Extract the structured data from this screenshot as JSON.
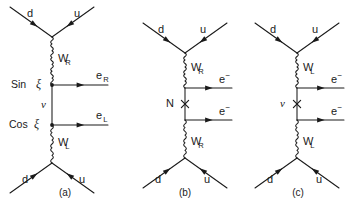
{
  "figure": {
    "background_color": "#ffffff",
    "line_color": "#1a1a1a",
    "width": 350,
    "height": 211
  },
  "diagrams": [
    {
      "id": "a",
      "caption": "(a)",
      "caption_x": 57,
      "caption_y": 193,
      "top_vertex": {
        "x": 52,
        "y": 37
      },
      "bottom_vertex": {
        "x": 52,
        "y": 163
      },
      "upper_mix_vertex": {
        "x": 52,
        "y": 85
      },
      "lower_mix_vertex": {
        "x": 52,
        "y": 125
      },
      "quarks": {
        "top_in_label": "d",
        "top_out_label": "u",
        "bottom_in_label": "d",
        "bottom_out_label": "u",
        "top_in_label_x": 27,
        "top_in_label_y": 14,
        "top_out_label_x": 74,
        "top_out_label_y": 14,
        "bottom_in_label_x": 22,
        "bottom_in_label_y": 180,
        "bottom_out_label_x": 79,
        "bottom_out_label_y": 180
      },
      "bosons": [
        {
          "label_base": "W",
          "label_sub": "R",
          "x": 58,
          "y": 59,
          "from": {
            "x": 52,
            "y": 37
          },
          "to": {
            "x": 52,
            "y": 85
          }
        },
        {
          "label_base": "W",
          "label_sub": "L",
          "x": 58,
          "y": 143,
          "from": {
            "x": 52,
            "y": 125
          },
          "to": {
            "x": 52,
            "y": 163
          }
        }
      ],
      "leptons": [
        {
          "label_base": "e",
          "label_sup": "",
          "label_sub": "R",
          "line_y": 85,
          "x_start": 52,
          "x_end": 108,
          "label_x": 96,
          "label_y": 76
        },
        {
          "label_base": "e",
          "label_sup": "",
          "label_sub": "L",
          "line_y": 125,
          "x_start": 52,
          "x_end": 108,
          "label_x": 96,
          "label_y": 116
        }
      ],
      "mixing_labels": [
        {
          "text": "Sin",
          "symbol": "ξ",
          "x": 11,
          "y": 85
        },
        {
          "text": "Cos",
          "symbol": "ξ",
          "x": 9,
          "y": 125
        }
      ],
      "propagator_label": {
        "symbol": "ν",
        "x": 41,
        "y": 105
      },
      "has_cross": false
    },
    {
      "id": "b",
      "caption": "(b)",
      "caption_x": 177,
      "caption_y": 193,
      "top_vertex": {
        "x": 185,
        "y": 53
      },
      "bottom_vertex": {
        "x": 185,
        "y": 158
      },
      "upper_mix_vertex": {
        "x": 185,
        "y": 88
      },
      "lower_mix_vertex": {
        "x": 185,
        "y": 120
      },
      "quarks": {
        "top_in_label": "d",
        "top_out_label": "u",
        "bottom_in_label": "d",
        "bottom_out_label": "u",
        "top_in_label_x": 158,
        "top_in_label_y": 30,
        "top_out_label_x": 200,
        "top_out_label_y": 30,
        "bottom_in_label_x": 155,
        "bottom_in_label_y": 180,
        "bottom_out_label_x": 204,
        "bottom_out_label_y": 180
      },
      "bosons": [
        {
          "label_base": "W",
          "label_sub": "R",
          "x": 191,
          "y": 68,
          "from": {
            "x": 185,
            "y": 53
          },
          "to": {
            "x": 185,
            "y": 88
          }
        },
        {
          "label_base": "W",
          "label_sub": "R",
          "x": 191,
          "y": 142,
          "from": {
            "x": 185,
            "y": 120
          },
          "to": {
            "x": 185,
            "y": 158
          }
        }
      ],
      "leptons": [
        {
          "label_base": "e",
          "label_sup": "−",
          "label_sub": "",
          "line_y": 88,
          "x_start": 185,
          "x_end": 232,
          "label_x": 219,
          "label_y": 80
        },
        {
          "label_base": "e",
          "label_sup": "−",
          "label_sub": "",
          "line_y": 120,
          "x_start": 185,
          "x_end": 232,
          "label_x": 219,
          "label_y": 112
        }
      ],
      "mixing_labels": [],
      "propagator_label": {
        "symbol": "N",
        "x": 166,
        "y": 104
      },
      "has_cross": true,
      "cross": {
        "x": 185,
        "y": 104,
        "size": 3.6
      }
    },
    {
      "id": "c",
      "caption": "(c)",
      "caption_x": 290,
      "caption_y": 193,
      "top_vertex": {
        "x": 297,
        "y": 53
      },
      "bottom_vertex": {
        "x": 297,
        "y": 158
      },
      "upper_mix_vertex": {
        "x": 297,
        "y": 88
      },
      "lower_mix_vertex": {
        "x": 297,
        "y": 120
      },
      "quarks": {
        "top_in_label": "d",
        "top_out_label": "u",
        "bottom_in_label": "d",
        "bottom_out_label": "u",
        "top_in_label_x": 270,
        "top_in_label_y": 30,
        "top_out_label_x": 312,
        "top_out_label_y": 30,
        "bottom_in_label_x": 267,
        "bottom_in_label_y": 180,
        "bottom_out_label_x": 316,
        "bottom_out_label_y": 180
      },
      "bosons": [
        {
          "label_base": "W",
          "label_sub": "L",
          "x": 303,
          "y": 68,
          "from": {
            "x": 297,
            "y": 53
          },
          "to": {
            "x": 297,
            "y": 88
          }
        },
        {
          "label_base": "W",
          "label_sub": "L",
          "x": 303,
          "y": 142,
          "from": {
            "x": 297,
            "y": 120
          },
          "to": {
            "x": 297,
            "y": 158
          }
        }
      ],
      "leptons": [
        {
          "label_base": "e",
          "label_sup": "−",
          "label_sub": "",
          "line_y": 88,
          "x_start": 297,
          "x_end": 344,
          "label_x": 331,
          "label_y": 80
        },
        {
          "label_base": "e",
          "label_sup": "−",
          "label_sub": "",
          "line_y": 120,
          "x_start": 297,
          "x_end": 344,
          "label_x": 331,
          "label_y": 112
        }
      ],
      "mixing_labels": [],
      "propagator_label": {
        "symbol": "ν",
        "x": 280,
        "y": 104
      },
      "has_cross": true,
      "cross": {
        "x": 297,
        "y": 104,
        "size": 3.6
      }
    }
  ]
}
